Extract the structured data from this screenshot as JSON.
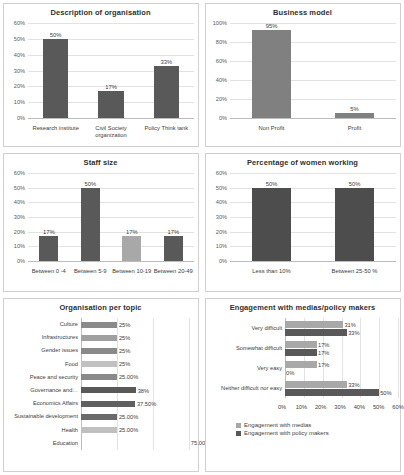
{
  "charts": [
    {
      "id": "description-of-organisation",
      "chart_data": {
        "type": "bar",
        "title": "Description of organisation",
        "categories": [
          "Research institute",
          "Civil Society organization",
          "Policy Think tank"
        ],
        "values": [
          50,
          17,
          33
        ],
        "labels": [
          "50%",
          "17%",
          "33%"
        ],
        "yticks": [
          "0%",
          "10%",
          "20%",
          "30%",
          "40%",
          "50%",
          "60%"
        ],
        "ylim": [
          0,
          60
        ],
        "xlabel": "",
        "ylabel": "",
        "grid": true,
        "series_colors": [
          "#595959",
          "#595959",
          "#595959"
        ]
      }
    },
    {
      "id": "business-model",
      "chart_data": {
        "type": "bar",
        "title": "Business model",
        "categories": [
          "Non Profit",
          "Profit"
        ],
        "values": [
          95,
          5
        ],
        "labels": [
          "95%",
          "5%"
        ],
        "yticks": [
          "0%",
          "20%",
          "40%",
          "60%",
          "80%",
          "100%"
        ],
        "ylim": [
          0,
          100
        ],
        "xlabel": "",
        "ylabel": "",
        "grid": true,
        "series_colors": [
          "#808080",
          "#808080"
        ]
      }
    },
    {
      "id": "staff-size",
      "chart_data": {
        "type": "bar",
        "title": "Staff size",
        "categories": [
          "Between 0 -4",
          "Between 5-9",
          "Between 10-19",
          "Between 20-49"
        ],
        "values": [
          17,
          50,
          17,
          17
        ],
        "labels": [
          "17%",
          "50%",
          "17%",
          "17%"
        ],
        "yticks": [
          "0%",
          "10%",
          "20%",
          "30%",
          "40%",
          "50%",
          "60%"
        ],
        "ylim": [
          0,
          60
        ],
        "xlabel": "",
        "ylabel": "",
        "grid": true,
        "series_colors": [
          "#595959",
          "#595959",
          "#a8a8a8",
          "#595959"
        ]
      }
    },
    {
      "id": "percentage-of-women-working",
      "chart_data": {
        "type": "bar",
        "title": "Percentage of women working",
        "categories": [
          "Less than 10%",
          "Between 25-50 %"
        ],
        "values": [
          50,
          50
        ],
        "labels": [
          "50%",
          "50%"
        ],
        "yticks": [
          "0%",
          "10%",
          "20%",
          "30%",
          "40%",
          "50%",
          "60%"
        ],
        "ylim": [
          0,
          60
        ],
        "xlabel": "",
        "ylabel": "",
        "grid": true,
        "series_colors": [
          "#4d4d4d",
          "#4d4d4d"
        ]
      }
    },
    {
      "id": "organisation-per-topic",
      "chart_data": {
        "type": "bar",
        "orientation": "horizontal",
        "title": "Organisation per topic",
        "categories": [
          "Culture",
          "Infrastructures",
          "Gender issues",
          "Food",
          "Peace and security",
          "Governance and…",
          "Economics Affairs",
          "Sustainable development",
          "Health",
          "Education"
        ],
        "values": [
          25,
          25,
          25,
          25,
          25,
          38,
          37.5,
          25,
          25,
          75
        ],
        "labels": [
          "25%",
          "25%",
          "25%",
          "25%",
          "25.00%",
          "38%",
          "37.50%",
          "25.00%",
          "25.00%",
          "75.00%"
        ],
        "xlim": [
          0,
          80
        ],
        "xlabel": "",
        "ylabel": "",
        "grid": true,
        "bar_shades": [
          "#8a8a8a",
          "#a0a0a0",
          "#8a8a8a",
          "#c0c0c0",
          "#8a8a8a",
          "#595959",
          "#5f5f5f",
          "#6a6a6a",
          "#c0c0c0",
          "#ffffff"
        ]
      }
    },
    {
      "id": "engagement-with-medias-policy-makers",
      "chart_data": {
        "type": "bar",
        "orientation": "horizontal",
        "title": "Engagement with medias/policy makers",
        "categories": [
          "Very difficult",
          "Somewhat difficult",
          "Very easy",
          "Neither difficult nor easy"
        ],
        "series": [
          {
            "name": "Engagement with medias",
            "values": [
              31,
              17,
              17,
              33
            ],
            "labels": [
              "31%",
              "17%",
              "17%",
              "33%"
            ],
            "color": "#a8a8a8"
          },
          {
            "name": "Engagement with policy makers",
            "values": [
              33,
              17,
              0,
              50
            ],
            "labels": [
              "33%",
              "17%",
              "0%",
              "50%"
            ],
            "color": "#595959"
          }
        ],
        "xticks": [
          "0%",
          "10%",
          "20%",
          "30%",
          "40%",
          "50%",
          "60%"
        ],
        "xlim": [
          0,
          60
        ],
        "xlabel": "",
        "ylabel": "",
        "grid": true,
        "legend_position": "bottom"
      }
    }
  ]
}
